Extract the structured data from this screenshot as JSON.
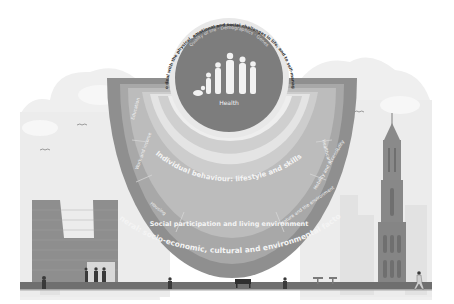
{
  "diagram": {
    "title_arc": "Health as the ability to deal with the physical, emotional and social challenges in life, and to self-manage as much as possible",
    "core": {
      "label": "Health",
      "ring_text": "Quality of life · Demographics · Genes",
      "icon": "people-of-all-ages-icon"
    },
    "layers": [
      {
        "id": "core-ring",
        "label": "Age, sex and genetic factors"
      },
      {
        "id": "individual-behaviour",
        "label": "Individual behaviour: lifestyle and skills"
      },
      {
        "id": "social-environment",
        "label": "Social environment: personal relationships and social network"
      },
      {
        "id": "living-environment",
        "label": "Social participation and living environment"
      },
      {
        "id": "general",
        "label": "General: socio-economic, cultural and environmental factors"
      }
    ],
    "segments": [
      {
        "label": "Education"
      },
      {
        "label": "Work and income"
      },
      {
        "label": "Housing"
      },
      {
        "label": "Social participation and living environment"
      },
      {
        "label": "Nature and the environment"
      },
      {
        "label": "Mobility and accessibility"
      },
      {
        "label": "Healthcare"
      }
    ],
    "colors": {
      "outer_ring": "#8c8c8c",
      "segment_ring": "#a9a9a9",
      "social_ring": "#c2c2c2",
      "individual_ring": "#d4d4d4",
      "light_band": "#e6e6e6",
      "core": "#7a7a7a",
      "sky": "#eeeeee",
      "ground": "#6e6e6e"
    }
  },
  "scene": {
    "left_building": "brick-apartment-building",
    "right_building": "cathedral-tower",
    "people": [
      "pedestrian",
      "group-of-people",
      "bench-sitters",
      "person-walking",
      "cafe-table",
      "runner"
    ],
    "birds": [
      "bird",
      "bird",
      "bird"
    ]
  }
}
